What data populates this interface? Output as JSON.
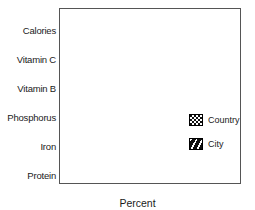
{
  "chart_data": {
    "type": "bar",
    "orientation": "horizontal",
    "title": "",
    "xlabel": "Percent",
    "ylabel": "",
    "xlim": [
      0,
      16
    ],
    "xticks": [
      0,
      4,
      8,
      12,
      16
    ],
    "xtick_labels": [
      "0",
      "4",
      "8",
      "12",
      "16"
    ],
    "grid": false,
    "legend_position": "right-center",
    "categories": [
      "Calories",
      "Vitamin C",
      "Vitamin B",
      "Phosphorus",
      "Iron",
      "Protein"
    ],
    "series": [
      {
        "name": "Country",
        "pattern": "checkerboard",
        "values": [
          5.2,
          13.0,
          8.6,
          7.0,
          4.0,
          2.5
        ]
      },
      {
        "name": "City",
        "pattern": "diagonal-hatch",
        "values": [
          4.8,
          8.0,
          5.8,
          9.5,
          8.8,
          2.5
        ]
      }
    ]
  },
  "axis": {
    "x_title": "Percent",
    "ticks": [
      "0",
      "4",
      "8",
      "12",
      "16"
    ]
  },
  "categories": [
    {
      "label": "Calories"
    },
    {
      "label": "Vitamin C"
    },
    {
      "label": "Vitamin B"
    },
    {
      "label": "Phosphorus"
    },
    {
      "label": "Iron"
    },
    {
      "label": "Protein"
    }
  ],
  "legend": {
    "entries": [
      {
        "label": "Country",
        "pattern": "checkerboard"
      },
      {
        "label": "City",
        "pattern": "diagonal-hatch"
      }
    ]
  },
  "colors": {
    "bar_fill": "#111111",
    "bar_accent": "#ffffff",
    "frame": "#555555",
    "text": "#1a1a1a"
  }
}
